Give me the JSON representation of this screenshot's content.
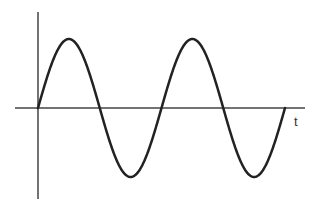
{
  "chart_data": {
    "type": "line",
    "title": "",
    "xlabel": "t",
    "ylabel": "",
    "function": "sine",
    "periods_shown": 2,
    "series": [
      {
        "name": "sine wave",
        "color": "#222222",
        "x": [
          0,
          0.25,
          0.5,
          0.75,
          1.0,
          1.25,
          1.5,
          1.75,
          2.0
        ],
        "values": [
          0,
          1,
          0,
          -1,
          0,
          1,
          0,
          -1,
          0
        ]
      }
    ],
    "xlim": [
      0,
      2
    ],
    "ylim": [
      -1,
      1
    ],
    "grid": false,
    "legend": null,
    "tick_labels": false
  },
  "axes": {
    "x_label": "t",
    "axis_color": "#444444",
    "curve_color": "#222222"
  }
}
